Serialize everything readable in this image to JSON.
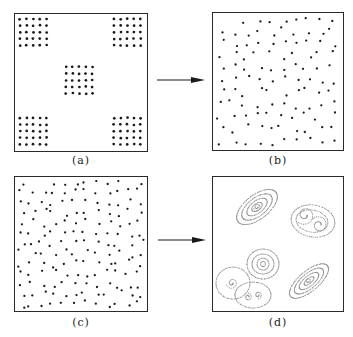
{
  "figure": {
    "panels": [
      {
        "id": "a",
        "label": "(a)",
        "description": "five square clusters of 5x5 particles (four corners and center)"
      },
      {
        "id": "b",
        "label": "(b)",
        "description": "particles spread randomly over the domain"
      },
      {
        "id": "c",
        "label": "(c)",
        "description": "initially random particle distribution"
      },
      {
        "id": "d",
        "label": "(d)",
        "description": "particles organized into dotted spiral vortex structures"
      }
    ],
    "arrows": [
      {
        "from": "a",
        "to": "b"
      },
      {
        "from": "c",
        "to": "d"
      }
    ],
    "colors": {
      "frame": "#2a2a2a",
      "dot": "#1a1a1a",
      "vortex_dots": "#8a8a8a",
      "arrow": "#1a1a1a"
    }
  }
}
